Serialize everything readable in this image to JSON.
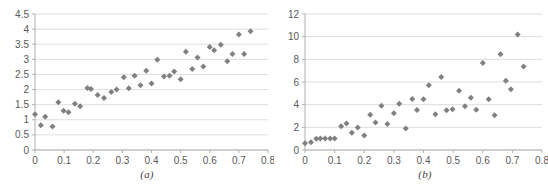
{
  "figure": {
    "background_color": "#ffffff",
    "marker_color": "#808080",
    "gridline_color": "#d4d4d4",
    "axis_color": "#b0b0b0",
    "tick_label_color": "#595959"
  },
  "panels": [
    {
      "caption": "(a)",
      "chart_data": {
        "type": "scatter",
        "title": "",
        "xlabel": "",
        "ylabel": "",
        "xlim": [
          0,
          0.8
        ],
        "ylim": [
          0,
          4.5
        ],
        "xticks": [
          "0",
          "0.1",
          "0.2",
          "0.3",
          "0.4",
          "0.5",
          "0.6",
          "0.7",
          "0.8"
        ],
        "xtick_values": [
          0,
          0.1,
          0.2,
          0.3,
          0.4,
          0.5,
          0.6,
          0.7,
          0.8
        ],
        "yticks": [
          "0",
          "0.5",
          "1",
          "1.5",
          "2",
          "2.5",
          "3",
          "3.5",
          "4",
          "4.5"
        ],
        "ytick_values": [
          0,
          0.5,
          1,
          1.5,
          2,
          2.5,
          3,
          3.5,
          4,
          4.5
        ],
        "grid": "horizontal",
        "legend": "none",
        "marker": "diamond",
        "points": [
          [
            0.0,
            1.18
          ],
          [
            0.02,
            0.82
          ],
          [
            0.035,
            1.1
          ],
          [
            0.06,
            0.78
          ],
          [
            0.08,
            1.58
          ],
          [
            0.098,
            1.3
          ],
          [
            0.115,
            1.25
          ],
          [
            0.137,
            1.53
          ],
          [
            0.155,
            1.45
          ],
          [
            0.18,
            2.05
          ],
          [
            0.192,
            2.02
          ],
          [
            0.215,
            1.82
          ],
          [
            0.237,
            1.72
          ],
          [
            0.262,
            1.92
          ],
          [
            0.28,
            2.0
          ],
          [
            0.305,
            2.41
          ],
          [
            0.322,
            2.04
          ],
          [
            0.342,
            2.46
          ],
          [
            0.362,
            2.14
          ],
          [
            0.382,
            2.62
          ],
          [
            0.4,
            2.2
          ],
          [
            0.42,
            2.99
          ],
          [
            0.443,
            2.43
          ],
          [
            0.462,
            2.46
          ],
          [
            0.478,
            2.6
          ],
          [
            0.5,
            2.34
          ],
          [
            0.518,
            3.25
          ],
          [
            0.54,
            2.68
          ],
          [
            0.558,
            3.06
          ],
          [
            0.578,
            2.76
          ],
          [
            0.6,
            3.41
          ],
          [
            0.615,
            3.3
          ],
          [
            0.638,
            3.48
          ],
          [
            0.66,
            2.94
          ],
          [
            0.678,
            3.18
          ],
          [
            0.7,
            3.82
          ],
          [
            0.718,
            3.18
          ],
          [
            0.74,
            3.93
          ]
        ]
      }
    },
    {
      "caption": "(b)",
      "chart_data": {
        "type": "scatter",
        "title": "",
        "xlabel": "",
        "ylabel": "",
        "xlim": [
          0,
          0.8
        ],
        "ylim": [
          0,
          12
        ],
        "xticks": [
          "0",
          "0.1",
          "0.2",
          "0.3",
          "0.4",
          "0.5",
          "0.6",
          "0.7",
          "0.8"
        ],
        "xtick_values": [
          0,
          0.1,
          0.2,
          0.3,
          0.4,
          0.5,
          0.6,
          0.7,
          0.8
        ],
        "yticks": [
          "0",
          "2",
          "4",
          "6",
          "8",
          "10",
          "12"
        ],
        "ytick_values": [
          0,
          2,
          4,
          6,
          8,
          10,
          12
        ],
        "grid": "horizontal",
        "legend": "none",
        "marker": "diamond",
        "points": [
          [
            0.0,
            0.6
          ],
          [
            0.02,
            0.68
          ],
          [
            0.038,
            1.0
          ],
          [
            0.052,
            1.02
          ],
          [
            0.068,
            1.02
          ],
          [
            0.085,
            1.02
          ],
          [
            0.1,
            1.02
          ],
          [
            0.122,
            2.1
          ],
          [
            0.14,
            2.33
          ],
          [
            0.158,
            1.52
          ],
          [
            0.178,
            1.98
          ],
          [
            0.2,
            1.28
          ],
          [
            0.22,
            3.12
          ],
          [
            0.238,
            2.42
          ],
          [
            0.258,
            3.9
          ],
          [
            0.278,
            2.3
          ],
          [
            0.3,
            3.24
          ],
          [
            0.318,
            4.08
          ],
          [
            0.34,
            1.9
          ],
          [
            0.362,
            4.5
          ],
          [
            0.378,
            3.52
          ],
          [
            0.4,
            4.48
          ],
          [
            0.418,
            5.72
          ],
          [
            0.44,
            3.16
          ],
          [
            0.46,
            6.45
          ],
          [
            0.478,
            3.5
          ],
          [
            0.498,
            3.6
          ],
          [
            0.52,
            5.22
          ],
          [
            0.54,
            3.86
          ],
          [
            0.56,
            4.6
          ],
          [
            0.578,
            3.56
          ],
          [
            0.6,
            7.68
          ],
          [
            0.62,
            4.48
          ],
          [
            0.64,
            3.06
          ],
          [
            0.66,
            8.45
          ],
          [
            0.678,
            6.12
          ],
          [
            0.695,
            5.35
          ],
          [
            0.718,
            10.2
          ],
          [
            0.738,
            7.36
          ]
        ]
      }
    }
  ]
}
